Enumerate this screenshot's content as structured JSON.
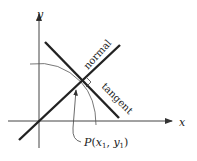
{
  "diagram": {
    "axes": {
      "x_label": "x",
      "y_label": "y"
    },
    "lines": {
      "normal_label": "normal",
      "tangent_label": "tangent"
    },
    "point": {
      "label_prefix": "P(",
      "x_var": "x",
      "x_sub": "1",
      "sep": ", ",
      "y_var": "y",
      "y_sub": "1",
      "label_suffix": ")"
    },
    "colors": {
      "ink": "#222222",
      "curve": "#555555"
    }
  }
}
